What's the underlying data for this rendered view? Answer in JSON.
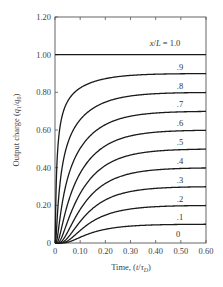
{
  "chart_data": {
    "type": "line",
    "title": "",
    "xlabel": "Time, (t/τ_D)",
    "ylabel": "Output charge (q_1/q_0)",
    "xlim": [
      0,
      0.6
    ],
    "ylim": [
      0,
      1.2
    ],
    "grid": false,
    "legend": "inline labels at right end of each curve",
    "x_ticks": [
      "0",
      "0.10",
      "0.20",
      "0.30",
      "0.40",
      "0.50",
      "0.60"
    ],
    "y_ticks": [
      "0",
      "0.20",
      "0.40",
      "0.60",
      "0.80",
      "1.00",
      "1.20"
    ],
    "x": [
      0,
      0.01,
      0.02,
      0.05,
      0.1,
      0.2,
      0.3,
      0.4,
      0.5,
      0.6
    ],
    "series": [
      {
        "name": "x/L = 1.0",
        "label": "x/L = 1.0",
        "param": 1.0,
        "values": [
          1.0,
          1.0,
          1.0,
          1.0,
          1.0,
          1.0,
          1.0,
          1.0,
          1.0,
          1.0
        ]
      },
      {
        "name": ".9",
        "label": ".9",
        "param": 0.9,
        "values": [
          0.0,
          0.48,
          0.62,
          0.75,
          0.81,
          0.86,
          0.88,
          0.89,
          0.895,
          0.9
        ]
      },
      {
        "name": ".8",
        "label": ".8",
        "param": 0.8,
        "values": [
          0.0,
          0.16,
          0.32,
          0.52,
          0.63,
          0.72,
          0.76,
          0.78,
          0.79,
          0.8
        ]
      },
      {
        "name": ".7",
        "label": ".7",
        "param": 0.7,
        "values": [
          0.0,
          0.04,
          0.13,
          0.33,
          0.47,
          0.59,
          0.64,
          0.67,
          0.69,
          0.7
        ]
      },
      {
        "name": ".6",
        "label": ".6",
        "param": 0.6,
        "values": [
          0.0,
          0.01,
          0.05,
          0.2,
          0.34,
          0.46,
          0.53,
          0.56,
          0.58,
          0.59
        ]
      },
      {
        "name": ".5",
        "label": ".5",
        "param": 0.5,
        "values": [
          0.0,
          0.0,
          0.01,
          0.11,
          0.24,
          0.36,
          0.42,
          0.46,
          0.48,
          0.49
        ]
      },
      {
        "name": ".4",
        "label": ".4",
        "param": 0.4,
        "values": [
          0.0,
          0.0,
          0.0,
          0.06,
          0.16,
          0.27,
          0.33,
          0.36,
          0.38,
          0.39
        ]
      },
      {
        "name": ".3",
        "label": ".3",
        "param": 0.3,
        "values": [
          0.0,
          0.0,
          0.0,
          0.03,
          0.1,
          0.19,
          0.24,
          0.27,
          0.29,
          0.295
        ]
      },
      {
        "name": ".2",
        "label": ".2",
        "param": 0.2,
        "values": [
          0.0,
          0.0,
          0.0,
          0.01,
          0.05,
          0.12,
          0.16,
          0.18,
          0.19,
          0.195
        ]
      },
      {
        "name": ".1",
        "label": ".1",
        "param": 0.1,
        "values": [
          0.0,
          0.0,
          0.0,
          0.0,
          0.02,
          0.06,
          0.08,
          0.09,
          0.095,
          0.098
        ]
      },
      {
        "name": "0",
        "label": "0",
        "param": 0.0,
        "values": [
          0.0,
          0.0,
          0.0,
          0.0,
          0.0,
          0.0,
          0.0,
          0.0,
          0.0,
          0.0
        ]
      }
    ]
  },
  "axes": {
    "x_title_main": "Time, (",
    "x_title_var": "t",
    "x_title_slash": "/",
    "x_title_tau": "τ",
    "x_title_sub": "D",
    "x_title_close": ")",
    "y_title_main": "Output charge (",
    "y_title_q": "q",
    "y_title_sub1": "1",
    "y_title_slash": "/",
    "y_title_q0": "q",
    "y_title_sub0": "0",
    "y_title_close": ")"
  },
  "colors": {
    "line": "#1a1a1a",
    "axis": "#555555",
    "text": "#444444",
    "background": "#ffffff"
  }
}
